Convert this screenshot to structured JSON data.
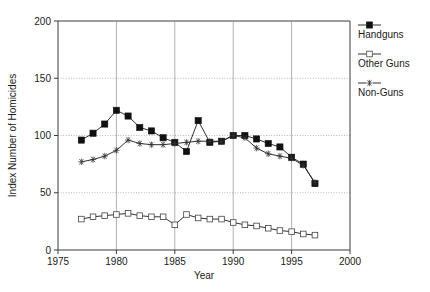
{
  "chart_data": {
    "type": "line",
    "title": "",
    "xlabel": "Year",
    "ylabel": "Index Number of Homicides",
    "xlim": [
      1975,
      2000
    ],
    "ylim": [
      0,
      200
    ],
    "xticks": [
      1975,
      1980,
      1985,
      1990,
      1995,
      2000
    ],
    "yticks": [
      0,
      50,
      100,
      150,
      200
    ],
    "grid": true,
    "legend_position": "right-outside",
    "x": [
      1977,
      1978,
      1979,
      1980,
      1981,
      1982,
      1983,
      1984,
      1985,
      1986,
      1987,
      1988,
      1989,
      1990,
      1991,
      1992,
      1993,
      1994,
      1995,
      1996,
      1997
    ],
    "series": [
      {
        "name": "Handguns",
        "marker": "filled-square",
        "values": [
          96,
          102,
          110,
          122,
          117,
          107,
          104,
          98,
          94,
          86,
          113,
          94,
          95,
          100,
          100,
          97,
          93,
          90,
          81,
          75,
          58
        ]
      },
      {
        "name": "Other Guns",
        "marker": "open-square",
        "values": [
          27,
          29,
          30,
          31,
          32,
          30,
          29,
          29,
          22,
          31,
          28,
          27,
          27,
          24,
          22,
          21,
          19,
          17,
          16,
          14,
          13
        ]
      },
      {
        "name": "Non-Guns",
        "marker": "asterisk",
        "values": [
          77,
          79,
          82,
          87,
          96,
          93,
          92,
          92,
          93,
          94,
          95,
          95,
          95,
          100,
          98,
          89,
          84,
          82,
          80,
          74,
          59
        ]
      }
    ]
  },
  "axes": {
    "y_title": "Index Number of Homicides",
    "x_title": "Year",
    "y_tick_labels": [
      "0",
      "50",
      "100",
      "150",
      "200"
    ],
    "x_tick_labels": [
      "1975",
      "1980",
      "1985",
      "1990",
      "1995",
      "2000"
    ]
  },
  "legend": {
    "entries": [
      {
        "label": "Handguns",
        "marker": "filled-square-marker"
      },
      {
        "label": "Other Guns",
        "marker": "open-square-marker"
      },
      {
        "label": "Non-Guns",
        "marker": "asterisk-marker"
      }
    ]
  },
  "colors": {
    "ink": "#1a1a1a",
    "grid": "#9a9a9a",
    "background": "#ffffff"
  }
}
